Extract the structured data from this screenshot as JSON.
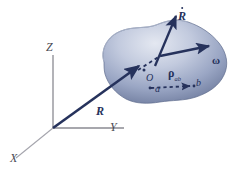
{
  "figure": {
    "background_color": "#ffffff",
    "body_color_light": "#d6dbe8",
    "body_color_mid": "#98a4c0",
    "body_color_dark": "#5d6a8c",
    "vector_color": "#26325c",
    "axis_color": "#8a8a92"
  },
  "axes": {
    "x_label": "X",
    "y_label": "Y",
    "z_label": "Z"
  },
  "vectors": {
    "position_label": "R",
    "velocity_label": "R",
    "velocity_accent": "dot",
    "angular_velocity_label": "ω",
    "relative_position_label": "ρ",
    "relative_position_subscript": "ab"
  },
  "points": {
    "origin_body_label": "O",
    "point_a_label": "a",
    "point_b_label": "b"
  }
}
